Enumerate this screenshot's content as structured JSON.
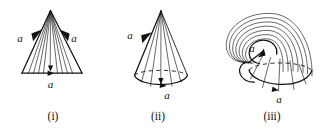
{
  "diagram": {
    "background_color": "#ffffff",
    "ink_color": "#1a1a1a",
    "panels": [
      {
        "id": "panel-i",
        "caption": "(i)",
        "shape": "triangle-fan",
        "description": "Isosceles triangle with fan of straight segments drawn from the apex to the base",
        "fan_line_count": 9,
        "edge_labels": [
          {
            "text": "a",
            "position": "left-slant",
            "x": 25,
            "y": 40,
            "arrow_direction": "up-left"
          },
          {
            "text": "a",
            "position": "right-slant",
            "x": 69,
            "y": 40,
            "arrow_direction": "up-right"
          },
          {
            "text": "a",
            "position": "base",
            "x": 50,
            "y": 88,
            "arrow_direction": "right"
          }
        ]
      },
      {
        "id": "panel-ii",
        "caption": "(ii)",
        "shape": "cone",
        "description": "Cone formed by joining the two slant edges; base circle drawn as ellipse with hidden back arc dashed",
        "fan_line_count": 5,
        "edge_labels": [
          {
            "text": "a",
            "position": "left-slant",
            "x": 127,
            "y": 40,
            "arrow_direction": "up-right"
          },
          {
            "text": "a",
            "position": "base-front",
            "x": 165,
            "y": 94,
            "arrow_direction": "right"
          }
        ]
      },
      {
        "id": "panel-iii",
        "caption": "(iii)",
        "shape": "folded-horn-cone",
        "description": "Cone bent over onto itself into a horn; nested arch curves sweep from the rim back around to an inner spiral loop",
        "nested_arc_count": 7,
        "edge_labels": [
          {
            "text": "a",
            "position": "inner-loop",
            "x": 256,
            "y": 50,
            "arrow_direction": "right"
          },
          {
            "text": "a",
            "position": "base-front",
            "x": 281,
            "y": 95,
            "arrow_direction": "right"
          }
        ]
      }
    ],
    "captions": {
      "i": "(i)",
      "ii": "(ii)",
      "iii": "(iii)"
    },
    "letters": {
      "a": "a"
    }
  }
}
